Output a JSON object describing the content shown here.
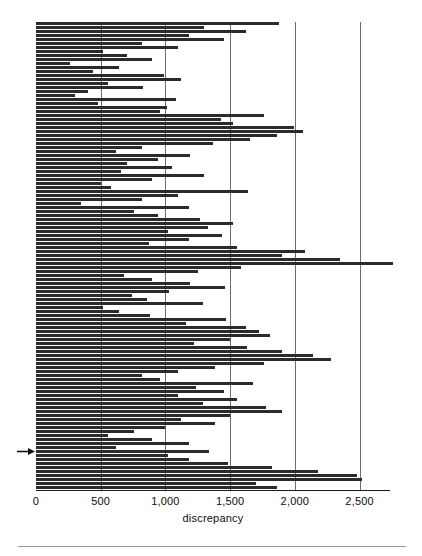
{
  "chart_data": {
    "type": "bar",
    "orientation": "horizontal",
    "title": "",
    "subtitle": "",
    "xlabel": "discrepancy",
    "ylabel": "",
    "xlim": [
      0,
      2735
    ],
    "grid": "vertical",
    "legend": null,
    "xticks": [
      0,
      500,
      1000,
      1500,
      2000,
      2500
    ],
    "xticklabels": [
      "0",
      "500",
      "1,000",
      "1,500",
      "2,000",
      "2,500"
    ],
    "gridline_values": [
      500,
      1000,
      1500,
      2000,
      2500
    ],
    "bar_color": "#2b2b2b",
    "gridline_color": "#6d6d6d",
    "axis_color": "#1a1a1a",
    "annotations": [
      {
        "type": "arrow-marker",
        "points": "right",
        "value_index": 107,
        "label": ""
      }
    ],
    "categories": [
      "1",
      "2",
      "3",
      "4",
      "5",
      "6",
      "7",
      "8",
      "9",
      "10",
      "11",
      "12",
      "13",
      "14",
      "15",
      "16",
      "17",
      "18",
      "19",
      "20",
      "21",
      "22",
      "23",
      "24",
      "25",
      "26",
      "27",
      "28",
      "29",
      "30",
      "31",
      "32",
      "33",
      "34",
      "35",
      "36",
      "37",
      "38",
      "39",
      "40",
      "41",
      "42",
      "43",
      "44",
      "45",
      "46",
      "47",
      "48",
      "49",
      "50",
      "51",
      "52",
      "53",
      "54",
      "55",
      "56",
      "57",
      "58",
      "59",
      "60",
      "61",
      "62",
      "63",
      "64",
      "65",
      "66",
      "67",
      "68",
      "69",
      "70",
      "71",
      "72",
      "73",
      "74",
      "75",
      "76",
      "77",
      "78",
      "79",
      "80",
      "81",
      "82",
      "83",
      "84",
      "85",
      "86",
      "87",
      "88",
      "89",
      "90",
      "91",
      "92",
      "93",
      "94",
      "95",
      "96",
      "97",
      "98",
      "99",
      "100",
      "101",
      "102",
      "103",
      "104",
      "105",
      "106",
      "107",
      "108",
      "109",
      "110",
      "111",
      "112",
      "113",
      "114",
      "115",
      "116",
      "117"
    ],
    "values": [
      1880,
      1300,
      1620,
      1180,
      1450,
      820,
      1100,
      520,
      700,
      900,
      260,
      640,
      440,
      990,
      1120,
      560,
      830,
      400,
      300,
      1080,
      480,
      1010,
      960,
      1760,
      1430,
      1520,
      1990,
      2060,
      1860,
      1650,
      1370,
      820,
      620,
      1190,
      940,
      700,
      1050,
      660,
      1300,
      900,
      500,
      580,
      1640,
      1100,
      820,
      350,
      1180,
      760,
      940,
      1270,
      1520,
      1330,
      1020,
      1440,
      1180,
      870,
      1550,
      2080,
      1900,
      2350,
      2760,
      1580,
      1250,
      680,
      900,
      1190,
      1460,
      1030,
      740,
      860,
      1290,
      520,
      640,
      880,
      1470,
      1160,
      1620,
      1720,
      1810,
      1500,
      1220,
      1630,
      1900,
      2140,
      2280,
      1760,
      1380,
      1100,
      820,
      960,
      1680,
      1240,
      1450,
      1100,
      1550,
      1290,
      1780,
      1900,
      1500,
      1120,
      1380,
      1000,
      760,
      560,
      900,
      1180,
      620,
      1340,
      1020,
      1180,
      1480,
      1820,
      2180,
      2480,
      2520,
      1700,
      1860
    ]
  }
}
